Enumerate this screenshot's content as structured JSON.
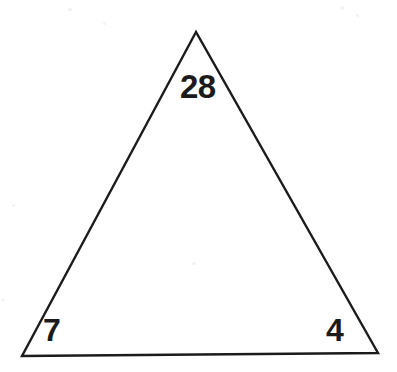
{
  "figure": {
    "kind": "geometry-diagram",
    "shape": "triangle",
    "background_color": "#ffffff",
    "stroke_color": "#1b1b1b",
    "stroke_width_px": 2,
    "fill": "none",
    "width_px": 397,
    "height_px": 372,
    "vertices": [
      {
        "name": "apex",
        "x": 196,
        "y": 32
      },
      {
        "name": "bottom-left",
        "x": 22,
        "y": 356
      },
      {
        "name": "bottom-right",
        "x": 378,
        "y": 353
      }
    ]
  },
  "labels": {
    "apex": "28",
    "bottom_left": "7",
    "bottom_right": "4"
  },
  "chart_data": {
    "type": "diagram",
    "title": "",
    "shape": "triangle",
    "annotations": [
      {
        "at_vertex": "apex",
        "text": "28",
        "x": 198,
        "y": 87
      },
      {
        "at_vertex": "bottom-left",
        "text": "7",
        "x": 51,
        "y": 330
      },
      {
        "at_vertex": "bottom-right",
        "text": "4",
        "x": 335,
        "y": 330
      }
    ],
    "values": [
      28,
      7,
      4
    ],
    "categories": [
      "apex",
      "bottom-left",
      "bottom-right"
    ]
  }
}
